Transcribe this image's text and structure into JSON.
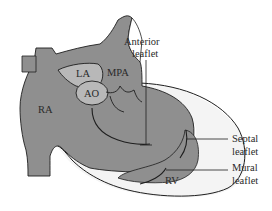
{
  "diagram": {
    "type": "anatomical-heart-cross-section",
    "labels": {
      "ra": "RA",
      "la": "LA",
      "ao": "AO",
      "mpa": "MPA",
      "rv": "RV",
      "anterior_line1": "Anterior",
      "anterior_line2": "leaflet",
      "septal_line1": "Septal",
      "septal_line2": "leaflet",
      "mural_line1": "Mural",
      "mural_line2": "leaflet"
    },
    "colors": {
      "dark_fill": "#8f8f8f",
      "light_fill": "#b8b8b8",
      "pale_fill": "#f4f4f4",
      "outline": "#1e1e1e",
      "background": "#ffffff"
    }
  }
}
